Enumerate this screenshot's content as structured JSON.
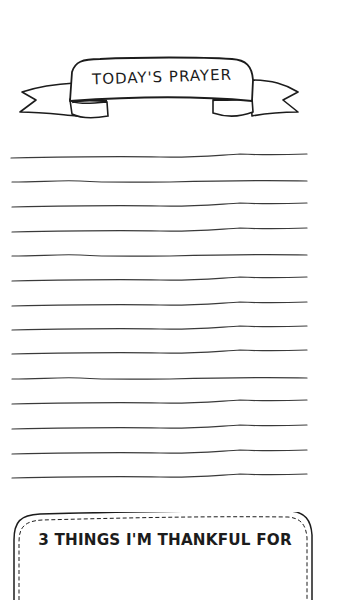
{
  "page": {
    "banner": {
      "title": "TODAY'S PRAYER"
    },
    "writing_area": {
      "line_count": 14
    },
    "thankful_box": {
      "title": "3 THINGS I'M THANKFUL FOR"
    }
  },
  "colors": {
    "ink": "#1c1c1c",
    "background": "#ffffff"
  }
}
